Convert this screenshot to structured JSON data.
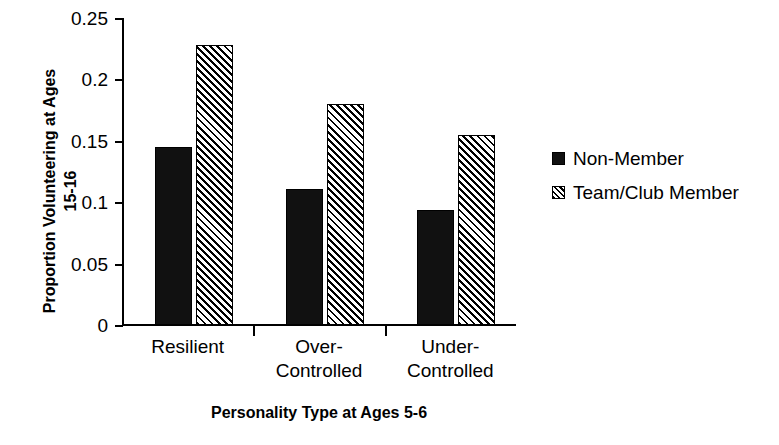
{
  "chart_data": {
    "type": "bar",
    "title": "",
    "subtitle": "",
    "xlabel": "Personality Type at Ages 5-6",
    "ylabel": "Proportion Volunteering at Ages 15-16",
    "ylabel_lines": [
      "Proportion Volunteering at Ages",
      "15-16"
    ],
    "categories": [
      "Resilient",
      "Over-Controlled",
      "Under-Controlled"
    ],
    "category_label_lines": [
      [
        "Resilient"
      ],
      [
        "Over-",
        "Controlled"
      ],
      [
        "Under-",
        "Controlled"
      ]
    ],
    "series": [
      {
        "name": "Non-Member",
        "fill": "solid",
        "color": "#111111",
        "values": [
          0.145,
          0.111,
          0.094
        ]
      },
      {
        "name": "Team/Club Member",
        "fill": "hatched",
        "color": "#000000",
        "values": [
          0.228,
          0.18,
          0.155
        ]
      }
    ],
    "ylim": [
      0,
      0.25
    ],
    "yticks": [
      0,
      0.05,
      0.1,
      0.15,
      0.2,
      0.25
    ],
    "ytick_labels": [
      "0",
      "0.05",
      "0.1",
      "0.15",
      "0.2",
      "0.25"
    ],
    "grid": false,
    "legend_position": "right"
  },
  "legend": {
    "entries": [
      {
        "label": "Non-Member"
      },
      {
        "label": "Team/Club Member"
      }
    ]
  },
  "colors": {
    "background": "#ffffff",
    "foreground": "#000000",
    "bar_solid": "#111111"
  }
}
